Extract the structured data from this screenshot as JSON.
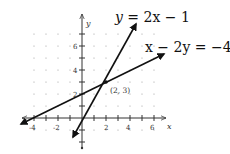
{
  "chart_data": {
    "type": "line",
    "title": "",
    "xlabel": "x",
    "ylabel": "y",
    "xlim": [
      -5,
      7
    ],
    "ylim": [
      -2,
      8
    ],
    "grid": "dotted",
    "x_ticks": [
      -4,
      -2,
      2,
      4,
      6
    ],
    "y_ticks": [
      2,
      4,
      6
    ],
    "series": [
      {
        "name": "y = 2x − 1",
        "equation": "y=2x-1",
        "slope": 2,
        "intercept": -1,
        "x": [
          -0.75,
          4.6
        ],
        "y": [
          -2.5,
          8.2
        ]
      },
      {
        "name": "x − 2y = −4",
        "equation": "x-2y=-4",
        "slope": 0.5,
        "intercept": 2,
        "x": [
          -5.1,
          6.9
        ],
        "y": [
          -0.55,
          5.45
        ]
      }
    ],
    "annotations": [
      {
        "text": "(2, 3)",
        "x": 2,
        "y": 3,
        "type": "intersection-point"
      }
    ],
    "legend": "none"
  },
  "labels": {
    "eq1_lhs": "y",
    "eq1_rhs": " = 2x − 1",
    "eq2": "x − 2y = −4",
    "point": "(2, 3)",
    "x_axis": "x",
    "y_axis": "y",
    "tick_x": [
      "-4",
      "-2",
      "2",
      "4",
      "6"
    ],
    "tick_y": [
      "6",
      "4",
      "2"
    ]
  }
}
